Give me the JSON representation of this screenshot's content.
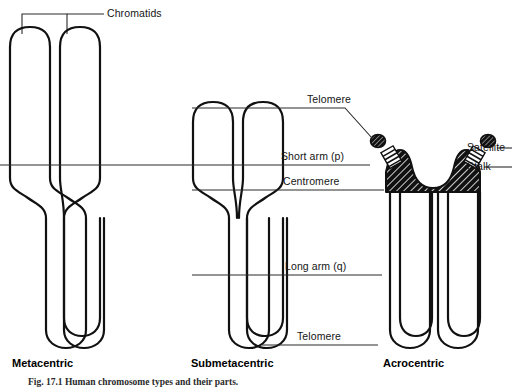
{
  "figure": {
    "background_color": "#ffffff",
    "ink_color": "#111111",
    "caption": "Fig. 17.1  Human chromosome types and their parts."
  },
  "labels": {
    "chromatids": "Chromatids",
    "telomere_top": "Telomere",
    "short_arm": "Short arm (p)",
    "centromere": "Centromere",
    "long_arm": "Long arm (q)",
    "telomere_bottom": "Telomere",
    "satellite": "Satellite",
    "stalk": "Stalk"
  },
  "chromosomes": [
    {
      "id": "metacentric",
      "caption": "Metacentric",
      "centromere_position": "median",
      "short_arm_relative_length": 0.5,
      "long_arm_relative_length": 0.5,
      "has_satellite": false,
      "has_stalk": false
    },
    {
      "id": "submetacentric",
      "caption": "Submetacentric",
      "centromere_position": "submedian",
      "short_arm_relative_length": 0.3,
      "long_arm_relative_length": 0.7,
      "has_satellite": false,
      "has_stalk": false
    },
    {
      "id": "acrocentric",
      "caption": "Acrocentric",
      "centromere_position": "terminal",
      "short_arm_relative_length": 0.08,
      "long_arm_relative_length": 0.92,
      "has_satellite": true,
      "has_stalk": true
    }
  ],
  "parts_legend": [
    {
      "name": "Chromatids",
      "description": "The two identical longitudinal halves of a replicated chromosome"
    },
    {
      "name": "Telomere",
      "description": "The terminal cap at each end of a chromatid arm"
    },
    {
      "name": "Short arm (p)",
      "description": "The shorter arm above the centromere"
    },
    {
      "name": "Centromere",
      "description": "The primary constriction joining the sister chromatids"
    },
    {
      "name": "Long arm (q)",
      "description": "The longer arm below the centromere"
    },
    {
      "name": "Satellite",
      "description": "Small rounded body distal to the stalk on acrocentric chromosomes"
    },
    {
      "name": "Stalk",
      "description": "Narrow secondary constriction connecting the satellite to the short arm"
    }
  ]
}
